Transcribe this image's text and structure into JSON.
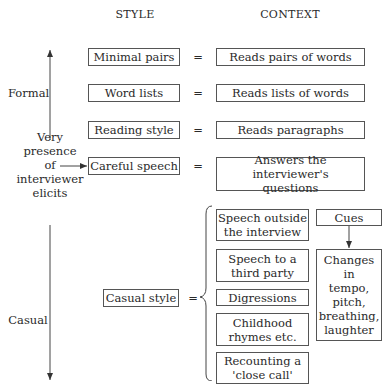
{
  "headers": {
    "style": "STYLE",
    "context": "CONTEXT"
  },
  "axis": {
    "top_label": "Formal",
    "bottom_label": "Casual",
    "middle_label": "Very\npresence\nof\ninterviewer\nelicits"
  },
  "equals": "=",
  "rows": [
    {
      "style": "Minimal pairs",
      "context": "Reads pairs of words"
    },
    {
      "style": "Word lists",
      "context": "Reads lists of words"
    },
    {
      "style": "Reading style",
      "context": "Reads paragraphs"
    },
    {
      "style": "Careful speech",
      "context": "Answers the interviewer's\nquestions"
    }
  ],
  "casual": {
    "style": "Casual style",
    "contexts": [
      "Speech outside\nthe interview",
      "Speech to a\nthird party",
      "Digressions",
      "Childhood\nrhymes etc.",
      "Recounting a\n'close call'"
    ],
    "cues_label": "Cues",
    "cues_detail": "Changes\nin\ntempo,\npitch,\nbreathing,\nlaughter"
  }
}
